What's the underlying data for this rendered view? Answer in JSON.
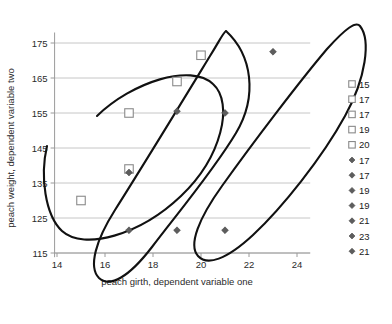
{
  "chart_data": {
    "type": "scatter",
    "title": "",
    "xlabel": "peach girth, dependent variable one",
    "ylabel": "peach weight, dependent variable two",
    "xlim": [
      13.2,
      24.9
    ],
    "ylim": [
      113.5,
      178.5
    ],
    "xticks": [
      14,
      16,
      18,
      20,
      22,
      24
    ],
    "yticks": [
      115,
      125,
      135,
      145,
      155,
      165,
      175
    ],
    "grid": "horizontal",
    "legend_position": "right",
    "series": [
      {
        "name": "squares",
        "marker": "open-square",
        "color": "#8a8a8a",
        "points": [
          {
            "x": 15,
            "y": 130
          },
          {
            "x": 17,
            "y": 139
          },
          {
            "x": 17,
            "y": 155
          },
          {
            "x": 19,
            "y": 164
          },
          {
            "x": 20,
            "y": 171.5
          }
        ]
      },
      {
        "name": "diamonds",
        "marker": "filled-diamond",
        "color": "#5d5d5d",
        "points": [
          {
            "x": 17,
            "y": 121.5
          },
          {
            "x": 17,
            "y": 138
          },
          {
            "x": 19,
            "y": 121.5
          },
          {
            "x": 19,
            "y": 155.5
          },
          {
            "x": 21,
            "y": 121.5
          },
          {
            "x": 23,
            "y": 172.5
          },
          {
            "x": 21,
            "y": 155
          }
        ]
      }
    ],
    "annotations": [
      {
        "type": "ellipse",
        "label": "cluster-ellipse-left"
      },
      {
        "type": "ellipse",
        "label": "cluster-ellipse-middle"
      },
      {
        "type": "ellipse",
        "label": "cluster-ellipse-right"
      }
    ]
  },
  "legend": {
    "items": [
      {
        "marker": "open-square",
        "label": "15"
      },
      {
        "marker": "open-square",
        "label": "17"
      },
      {
        "marker": "open-square",
        "label": "17"
      },
      {
        "marker": "open-square",
        "label": "19"
      },
      {
        "marker": "open-square",
        "label": "20"
      },
      {
        "marker": "filled-diamond",
        "label": "17"
      },
      {
        "marker": "filled-diamond",
        "label": "17"
      },
      {
        "marker": "filled-diamond",
        "label": "19"
      },
      {
        "marker": "filled-diamond",
        "label": "19"
      },
      {
        "marker": "filled-diamond",
        "label": "21"
      },
      {
        "marker": "filled-diamond",
        "label": "23"
      },
      {
        "marker": "filled-diamond",
        "label": "21"
      }
    ]
  },
  "axes": {
    "x_tick_labels": [
      "14",
      "16",
      "18",
      "20",
      "22",
      "24"
    ],
    "y_tick_labels": [
      "115",
      "125",
      "135",
      "145",
      "155",
      "165",
      "175"
    ],
    "x_title": "peach girth, dependent variable one",
    "y_title": "peach weight, dependent variable two"
  }
}
